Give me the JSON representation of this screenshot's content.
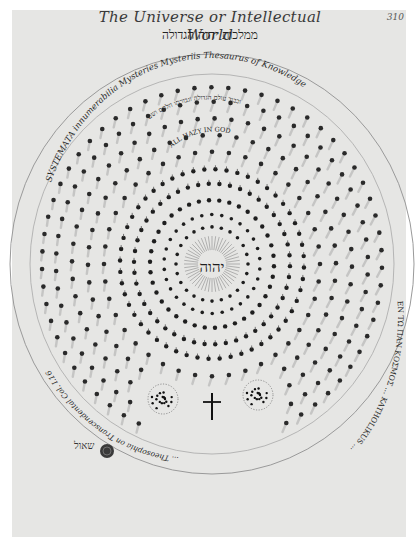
{
  "header": {
    "title": "The Universe or Intellectual World",
    "subtitle_hebrew": "ממלכות יהוה הגדולה",
    "page_number": "310"
  },
  "diagram": {
    "outer_ring_text_top": "SYSTEMATA innumerabilia Mysteries Mysteriis Thesaurus of Knowledge",
    "outer_ring_text_left": "... Theosophia on Transcendental Col. I.16",
    "outer_ring_text_bottom": "ΕΝ ΤΩ ΠΑΝ ΚΟΣΜΟΣ ... KATHOLIKUS ...",
    "inner_arc_hebrew": "וכבוד עולם הגדולה וגבורתו הלחם ושם",
    "all_in_god_label": "ALL HAZY IN GOD",
    "center_label": "יהוה",
    "lower_symbols": [
      "dotted-cluster-left",
      "cross",
      "dotted-cluster-right"
    ],
    "signature": "שאול",
    "colors": {
      "paper": "#e6e6e4",
      "ink": "#1e1e1e",
      "faint_ink": "#8a8a8a",
      "ring_line": "#9a9a9a"
    }
  }
}
